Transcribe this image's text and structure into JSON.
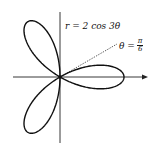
{
  "figure": {
    "equation_label": "r = 2 cos 3θ",
    "ray_label": {
      "lhs": "θ =",
      "numerator": "π",
      "denominator": "6"
    }
  },
  "chart_data": {
    "type": "line",
    "equation": "r = 2cos(3θ)",
    "coordinate_system": "polar",
    "amplitude": 2,
    "k": 3,
    "petals": 3,
    "petal_angles_deg": [
      0,
      120,
      240
    ],
    "annotations": [
      {
        "text": "r = 2 cos 3θ",
        "position": "top, right of vertical axis"
      },
      {
        "text": "θ = π/6",
        "type": "dashed ray from origin at 30°"
      }
    ],
    "axes": {
      "x_arrow": true,
      "y_arrow": false,
      "ticks": false
    },
    "grid": false
  }
}
